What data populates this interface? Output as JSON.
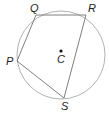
{
  "diagram": {
    "type": "inscribed-quadrilateral",
    "circle": {
      "cx": 61,
      "cy": 55,
      "r": 44,
      "stroke": "#9a9a9a"
    },
    "center": {
      "label": "C",
      "x": 61,
      "y": 51
    },
    "vertices": [
      {
        "label": "Q",
        "x": 36,
        "y": 15
      },
      {
        "label": "R",
        "x": 86,
        "y": 15
      },
      {
        "label": "S",
        "x": 64,
        "y": 98
      },
      {
        "label": "P",
        "x": 17,
        "y": 61
      }
    ],
    "edge_color": "#707070",
    "labels": {
      "Q": "Q",
      "R": "R",
      "P": "P",
      "S": "S",
      "C": "C"
    }
  }
}
